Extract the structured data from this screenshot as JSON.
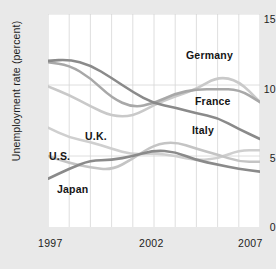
{
  "chart_data": {
    "type": "line",
    "title": "",
    "xlabel": "",
    "ylabel": "Unemployment rate (percent)",
    "xlim": [
      1997,
      2007
    ],
    "ylim": [
      0,
      15
    ],
    "yticks": [
      0,
      5,
      10,
      15
    ],
    "ytick_labels": [
      "0",
      "5",
      "10",
      "15"
    ],
    "xticks": [
      1997,
      2002,
      2007
    ],
    "xtick_labels": [
      "1997",
      "2002",
      "2007"
    ],
    "grid": "vertical gridlines every year, horizontal gridlines at 5, 10, 15",
    "legend": "inline labels on plot",
    "x": [
      1997,
      1998,
      1999,
      2000,
      2001,
      2002,
      2003,
      2004,
      2005,
      2006,
      2007
    ],
    "series": [
      {
        "name": "Germany",
        "color": "#c9c9c9",
        "label": "Germany",
        "values": [
          9.9,
          9.3,
          8.5,
          7.8,
          7.8,
          8.6,
          9.2,
          9.7,
          10.6,
          10.3,
          8.8
        ]
      },
      {
        "name": "France",
        "color": "#a8a8a8",
        "label": "France",
        "values": [
          11.6,
          11.4,
          10.5,
          9.1,
          8.4,
          8.7,
          9.4,
          9.7,
          9.7,
          9.7,
          8.8
        ]
      },
      {
        "name": "Italy",
        "color": "#8a8a8a",
        "label": "Italy",
        "values": [
          11.7,
          11.8,
          11.4,
          10.5,
          9.5,
          8.7,
          8.4,
          8.0,
          7.7,
          6.9,
          6.2
        ]
      },
      {
        "name": "U.K.",
        "color": "#cfcfcf",
        "label": "U.K.",
        "values": [
          7.0,
          6.3,
          6.0,
          5.5,
          5.1,
          5.2,
          5.0,
          4.7,
          4.8,
          5.4,
          5.4
        ]
      },
      {
        "name": "U.S.",
        "color": "#c4c4c4",
        "label": "U.S.",
        "values": [
          5.0,
          4.5,
          4.2,
          4.0,
          4.8,
          5.8,
          6.0,
          5.5,
          5.1,
          4.6,
          4.6
        ]
      },
      {
        "name": "Japan",
        "color": "#8a8a8a",
        "label": "Japan",
        "values": [
          3.4,
          4.1,
          4.7,
          4.7,
          5.0,
          5.4,
          5.3,
          4.7,
          4.4,
          4.1,
          3.9
        ]
      }
    ]
  },
  "axes": {
    "y_title": "Unemployment rate (percent)",
    "y_ticks": [
      "15",
      "10",
      "5",
      "0"
    ],
    "x_ticks": [
      "1997",
      "2002",
      "2007"
    ]
  },
  "labels": {
    "germany": "Germany",
    "france": "France",
    "italy": "Italy",
    "uk": "U.K.",
    "us": "U.S.",
    "japan": "Japan"
  }
}
